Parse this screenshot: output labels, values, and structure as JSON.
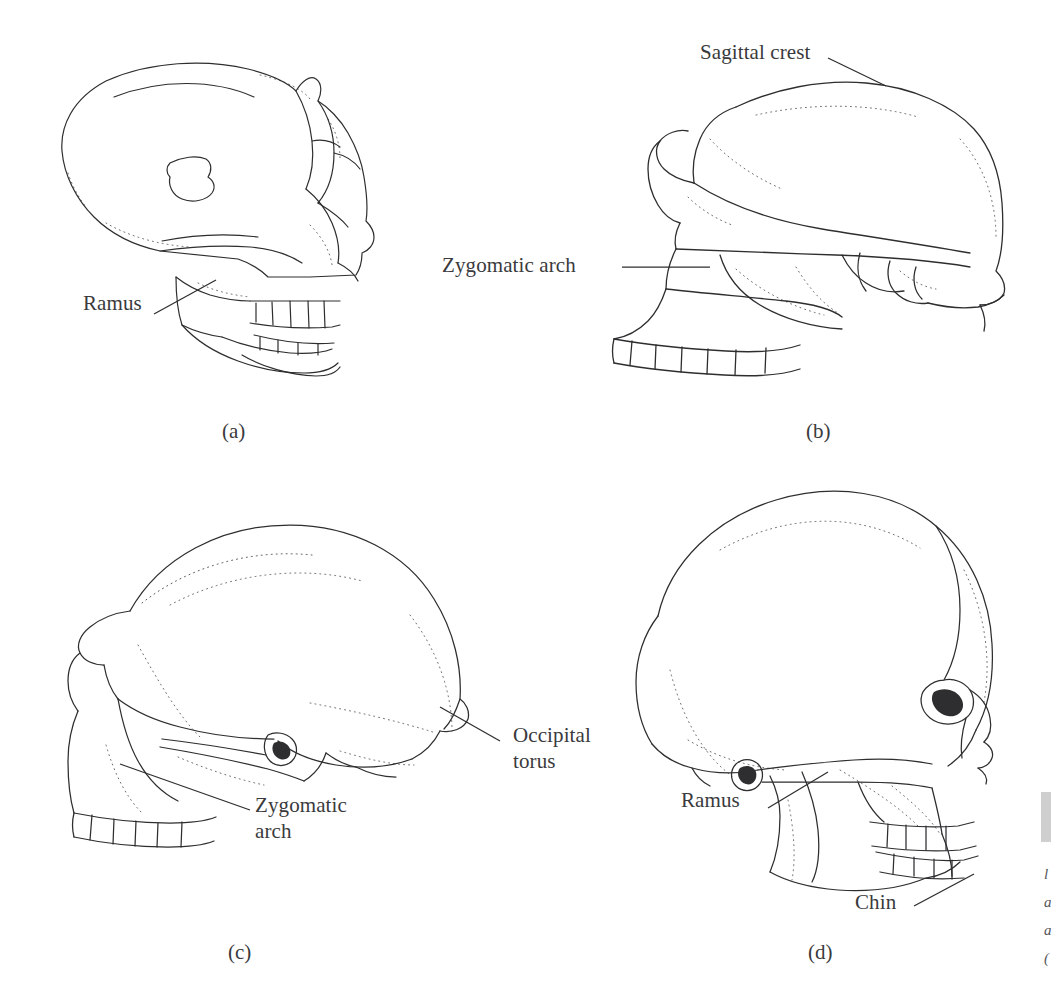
{
  "figure": {
    "type": "scientific-illustration",
    "background_color": "#ffffff",
    "ink_color": "#2e2e30",
    "label_color": "#3a3a3c",
    "width": 1051,
    "height": 994
  },
  "panels": [
    {
      "letter": "(a)",
      "name": "panel-a",
      "subject": "chimpanzee-like ape cranium with mandible, lateral view",
      "labels": [
        {
          "text": "Ramus",
          "name": "label-ramus"
        }
      ]
    },
    {
      "letter": "(b)",
      "name": "panel-b",
      "subject": "robust australopith cranium with sagittal crest, lateral view",
      "labels": [
        {
          "text": "Sagittal crest",
          "name": "label-sagittal-crest"
        },
        {
          "text": "Zygomatic arch",
          "name": "label-zygomatic-arch"
        }
      ]
    },
    {
      "letter": "(c)",
      "name": "panel-c",
      "subject": "Homo erectus cranium with occipital torus, lateral view",
      "labels": [
        {
          "text": "Occipital\ntorus",
          "name": "label-occipital-torus"
        },
        {
          "text": "Zygomatic\narch",
          "name": "label-zygomatic-arch"
        }
      ]
    },
    {
      "letter": "(d)",
      "name": "panel-d",
      "subject": "modern Homo sapiens skull with mandible, lateral view",
      "labels": [
        {
          "text": "Occipital\ntorus",
          "name": "label-occipital-torus"
        },
        {
          "text": "Ramus",
          "name": "label-ramus"
        },
        {
          "text": "Chin",
          "name": "label-chin"
        }
      ]
    }
  ],
  "edge_column": {
    "bar_color": "#cfcfcf",
    "fragments": [
      "l",
      "a",
      "a",
      "("
    ]
  }
}
